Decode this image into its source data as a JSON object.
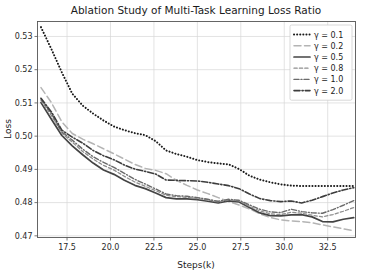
{
  "chart_data": {
    "type": "line",
    "title": "Ablation Study of Multi-Task Learning Loss Ratio",
    "xlabel": "Steps(k)",
    "ylabel": "Loss",
    "xlim": [
      15.8,
      34.1
    ],
    "ylim": [
      0.4695,
      0.5345
    ],
    "xticks": [
      17.5,
      20.0,
      22.5,
      25.0,
      27.5,
      30.0,
      32.5
    ],
    "xtick_labels": [
      "17.5",
      "20.0",
      "22.5",
      "25.0",
      "27.5",
      "30.0",
      "32.5"
    ],
    "yticks": [
      0.47,
      0.48,
      0.49,
      0.5,
      0.51,
      0.52,
      0.53
    ],
    "ytick_labels": [
      "0.47",
      "0.48",
      "0.49",
      "0.50",
      "0.51",
      "0.52",
      "0.53"
    ],
    "grid": true,
    "legend_position": "upper right",
    "x": [
      16.0,
      16.6,
      17.2,
      17.8,
      18.4,
      19.0,
      19.6,
      20.2,
      20.8,
      21.4,
      22.0,
      22.6,
      23.2,
      23.8,
      24.4,
      25.0,
      25.6,
      26.2,
      26.8,
      27.4,
      28.0,
      28.6,
      29.2,
      29.8,
      30.4,
      31.0,
      31.6,
      32.2,
      32.8,
      33.4,
      34.0
    ],
    "series": [
      {
        "name": "γ = 0.1",
        "label": "γ = 0.1",
        "linestyle": "dotted",
        "color": "#1a1a1a",
        "width": 2.0,
        "dash": "0.1,3.0",
        "values": [
          0.5328,
          0.5262,
          0.5192,
          0.5128,
          0.5092,
          0.5068,
          0.5047,
          0.5029,
          0.5018,
          0.5009,
          0.5003,
          0.4985,
          0.4957,
          0.4946,
          0.4938,
          0.4928,
          0.4922,
          0.4918,
          0.4915,
          0.4901,
          0.4881,
          0.4869,
          0.4861,
          0.4855,
          0.4851,
          0.485,
          0.485,
          0.485,
          0.485,
          0.485,
          0.485
        ]
      },
      {
        "name": "γ = 0.2",
        "label": "γ = 0.2",
        "linestyle": "long-dash",
        "color": "#b4b4b4",
        "width": 1.5,
        "dash": "7,3.5",
        "values": [
          0.5146,
          0.5101,
          0.5043,
          0.5008,
          0.4991,
          0.4977,
          0.4962,
          0.4947,
          0.4931,
          0.4915,
          0.4903,
          0.4897,
          0.4887,
          0.4867,
          0.4852,
          0.4838,
          0.4827,
          0.4815,
          0.4803,
          0.4793,
          0.4781,
          0.4766,
          0.4755,
          0.4748,
          0.4745,
          0.4743,
          0.4739,
          0.4733,
          0.4727,
          0.4721,
          0.4715
        ]
      },
      {
        "name": "γ = 0.5",
        "label": "γ = 0.5",
        "linestyle": "solid",
        "color": "#444444",
        "width": 1.7,
        "dash": "none",
        "values": [
          0.5101,
          0.5051,
          0.5002,
          0.4971,
          0.4944,
          0.4919,
          0.4898,
          0.4885,
          0.4867,
          0.4852,
          0.4842,
          0.4829,
          0.4815,
          0.4811,
          0.4811,
          0.4809,
          0.4804,
          0.4799,
          0.4805,
          0.4802,
          0.4785,
          0.4769,
          0.4761,
          0.476,
          0.4763,
          0.4764,
          0.4757,
          0.4743,
          0.4742,
          0.475,
          0.4755
        ]
      },
      {
        "name": "γ = 0.8",
        "label": "γ = 0.8",
        "linestyle": "fine-dash",
        "color": "#8e8e8e",
        "width": 1.3,
        "dash": "3.2,2.2",
        "values": [
          0.5108,
          0.5062,
          0.5009,
          0.4982,
          0.4954,
          0.4931,
          0.4912,
          0.4898,
          0.4879,
          0.4862,
          0.4849,
          0.4836,
          0.4822,
          0.4818,
          0.4816,
          0.4812,
          0.4808,
          0.4802,
          0.4808,
          0.4805,
          0.4789,
          0.4775,
          0.4766,
          0.4764,
          0.4771,
          0.4768,
          0.4762,
          0.4757,
          0.4764,
          0.4774,
          0.4785
        ]
      },
      {
        "name": "γ = 1.0",
        "label": "γ = 1.0",
        "linestyle": "dash-dot-fine",
        "color": "#6a6a6a",
        "width": 1.4,
        "dash": "5,2,1,2",
        "values": [
          0.5112,
          0.5068,
          0.5013,
          0.4988,
          0.4961,
          0.4938,
          0.4921,
          0.4906,
          0.4888,
          0.487,
          0.4856,
          0.4841,
          0.4826,
          0.4821,
          0.4819,
          0.4815,
          0.481,
          0.4804,
          0.481,
          0.4807,
          0.4793,
          0.478,
          0.4772,
          0.477,
          0.478,
          0.4773,
          0.4769,
          0.4768,
          0.4779,
          0.4792,
          0.4806
        ]
      },
      {
        "name": "γ = 2.0",
        "label": "γ = 2.0",
        "linestyle": "dash-dot",
        "color": "#3d3d3d",
        "width": 1.6,
        "dash": "6,2,1.2,2",
        "values": [
          0.5114,
          0.5073,
          0.5018,
          0.4997,
          0.4979,
          0.4957,
          0.4941,
          0.4929,
          0.4913,
          0.4901,
          0.4894,
          0.4886,
          0.4868,
          0.4867,
          0.4866,
          0.4865,
          0.4861,
          0.4856,
          0.4851,
          0.4842,
          0.4826,
          0.4812,
          0.4806,
          0.4803,
          0.4805,
          0.4799,
          0.4807,
          0.4818,
          0.4829,
          0.4838,
          0.4845
        ]
      }
    ]
  },
  "figure": {
    "title": "Ablation Study of Multi-Task Learning Loss Ratio",
    "xlabel": "Steps(k)",
    "ylabel": "Loss"
  }
}
